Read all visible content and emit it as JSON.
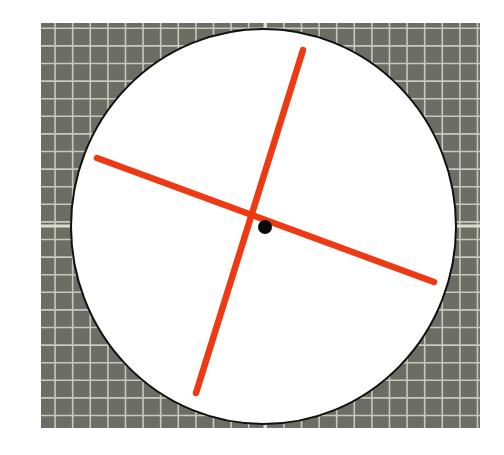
{
  "canvas": {
    "width": 504,
    "height": 455,
    "background": "#ffffff"
  },
  "grid": {
    "x": 41,
    "y": 23,
    "width": 439,
    "height": 405,
    "cell": 17.6,
    "fill": "#6c6d64",
    "line_color": "#c9c9bd",
    "line_width": 1.6,
    "axis_marker_y": 226,
    "axis_marker_x": 265,
    "axis_marker_color": "#dcdcd2"
  },
  "circle": {
    "cx": 263.5,
    "cy": 226.5,
    "rx": 192.5,
    "ry": 197.5,
    "fill": "#ffffff",
    "stroke": "#111111",
    "stroke_width": 2
  },
  "lines": [
    {
      "name": "near-vertical-axis-line",
      "x1": 303,
      "y1": 50,
      "x2": 196,
      "y2": 393,
      "color": "#ee3a14",
      "width": 6.5
    },
    {
      "name": "near-horizontal-axis-line",
      "x1": 97,
      "y1": 158,
      "x2": 434,
      "y2": 282,
      "color": "#ee3a14",
      "width": 6.5
    }
  ],
  "center_dot": {
    "cx": 265,
    "cy": 227,
    "r": 7,
    "color": "#0a0a0a"
  }
}
